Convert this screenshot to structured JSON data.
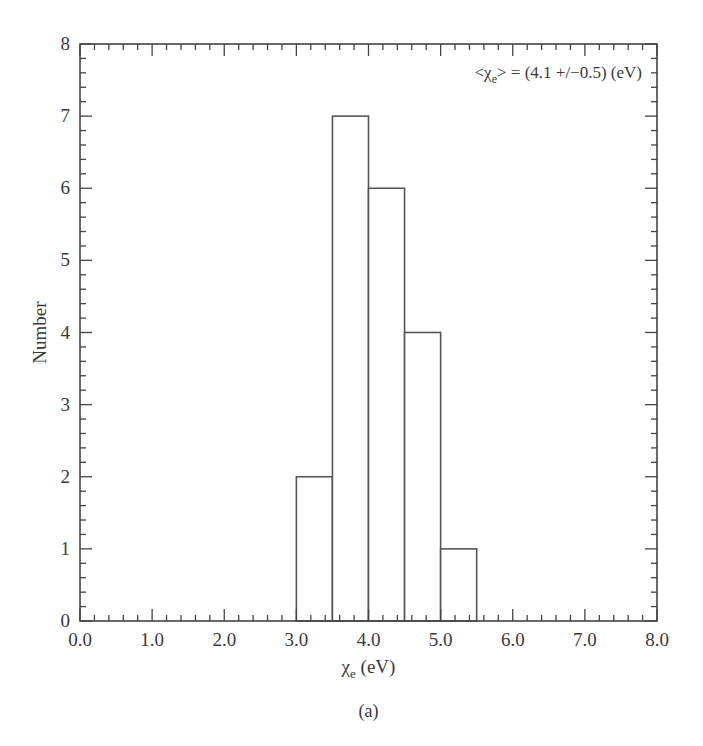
{
  "chart_data": {
    "type": "bar",
    "subtype": "histogram",
    "title": "",
    "caption": "(a)",
    "annotation": {
      "symbol": "χ",
      "subscript": "e",
      "text_prefix": "<",
      "text_suffix": "> = (4.1 +/−0.5) (eV)",
      "mean": 4.1,
      "uncertainty": 0.5,
      "unit": "eV",
      "position": "top-right"
    },
    "xlabel": {
      "symbol": "χ",
      "subscript": "e",
      "unit": " (eV)"
    },
    "ylabel": "Number",
    "xlim": [
      0.0,
      8.0
    ],
    "ylim": [
      0,
      8
    ],
    "xticks": [
      "0.0",
      "1.0",
      "2.0",
      "3.0",
      "4.0",
      "5.0",
      "6.0",
      "7.0",
      "8.0"
    ],
    "yticks": [
      "0",
      "1",
      "2",
      "3",
      "4",
      "5",
      "6",
      "7",
      "8"
    ],
    "x_minor_per_major": 5,
    "y_minor_per_major": 5,
    "grid": false,
    "legend": null,
    "bins": [
      {
        "x0": 3.0,
        "x1": 3.5,
        "count": 2
      },
      {
        "x0": 3.5,
        "x1": 4.0,
        "count": 7
      },
      {
        "x0": 4.0,
        "x1": 4.5,
        "count": 6
      },
      {
        "x0": 4.5,
        "x1": 5.0,
        "count": 4
      },
      {
        "x0": 5.0,
        "x1": 5.5,
        "count": 1
      }
    ],
    "categories": [
      "3.0-3.5",
      "3.5-4.0",
      "4.0-4.5",
      "4.5-5.0",
      "5.0-5.5"
    ],
    "values": [
      2,
      7,
      6,
      4,
      1
    ],
    "colors": {
      "axis": "#444444",
      "bar_edge": "#555555",
      "bar_fill": "#ffffff",
      "text": "#3a3a3a"
    }
  }
}
